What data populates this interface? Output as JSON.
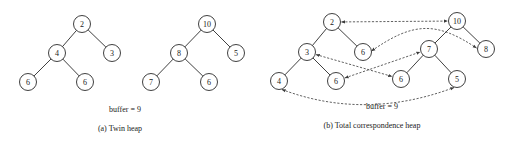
{
  "panels": [
    {
      "id": "a",
      "caption": "(a) Twin heap",
      "buffer_label": "buffer = 9",
      "caption_pos": [
        120,
        131
      ],
      "buffer_pos": [
        125,
        112
      ],
      "heaps": [
        {
          "name": "min-heap",
          "nodes": [
            {
              "id": "a_min_0",
              "value": "2",
              "x": 82,
              "y": 24
            },
            {
              "id": "a_min_1",
              "value": "4",
              "x": 57,
              "y": 53
            },
            {
              "id": "a_min_2",
              "value": "3",
              "x": 112,
              "y": 53
            },
            {
              "id": "a_min_3",
              "value": "6",
              "x": 28,
              "y": 82
            },
            {
              "id": "a_min_4",
              "value": "6",
              "x": 85,
              "y": 82
            }
          ],
          "edges": [
            [
              "a_min_0",
              "a_min_1"
            ],
            [
              "a_min_0",
              "a_min_2"
            ],
            [
              "a_min_1",
              "a_min_3"
            ],
            [
              "a_min_1",
              "a_min_4"
            ]
          ]
        },
        {
          "name": "max-heap",
          "nodes": [
            {
              "id": "a_max_0",
              "value": "10",
              "x": 207,
              "y": 24
            },
            {
              "id": "a_max_1",
              "value": "8",
              "x": 179,
              "y": 53
            },
            {
              "id": "a_max_2",
              "value": "5",
              "x": 236,
              "y": 53
            },
            {
              "id": "a_max_3",
              "value": "7",
              "x": 151,
              "y": 82
            },
            {
              "id": "a_max_4",
              "value": "6",
              "x": 209,
              "y": 82
            }
          ],
          "edges": [
            [
              "a_max_0",
              "a_max_1"
            ],
            [
              "a_max_0",
              "a_max_2"
            ],
            [
              "a_max_1",
              "a_max_3"
            ],
            [
              "a_max_1",
              "a_max_4"
            ]
          ]
        }
      ],
      "correspondences": []
    },
    {
      "id": "b",
      "caption": "(b) Total correspondence heap",
      "buffer_label": "buffer = 9",
      "caption_pos": [
        372,
        128
      ],
      "buffer_pos": [
        382,
        109
      ],
      "heaps": [
        {
          "name": "min-heap",
          "nodes": [
            {
              "id": "b_min_0",
              "value": "2",
              "x": 332,
              "y": 22
            },
            {
              "id": "b_min_1",
              "value": "3",
              "x": 307,
              "y": 52
            },
            {
              "id": "b_min_2",
              "value": "6",
              "x": 363,
              "y": 52
            },
            {
              "id": "b_min_3",
              "value": "4",
              "x": 279,
              "y": 81
            },
            {
              "id": "b_min_4",
              "value": "6",
              "x": 336,
              "y": 81
            }
          ],
          "edges": [
            [
              "b_min_0",
              "b_min_1"
            ],
            [
              "b_min_0",
              "b_min_2"
            ],
            [
              "b_min_1",
              "b_min_3"
            ],
            [
              "b_min_1",
              "b_min_4"
            ]
          ]
        },
        {
          "name": "max-heap",
          "nodes": [
            {
              "id": "b_max_0",
              "value": "10",
              "x": 457,
              "y": 21
            },
            {
              "id": "b_max_1",
              "value": "7",
              "x": 429,
              "y": 49
            },
            {
              "id": "b_max_2",
              "value": "8",
              "x": 486,
              "y": 49
            },
            {
              "id": "b_max_3",
              "value": "6",
              "x": 401,
              "y": 79
            },
            {
              "id": "b_max_4",
              "value": "5",
              "x": 457,
              "y": 79
            }
          ],
          "edges": [
            [
              "b_max_0",
              "b_max_1"
            ],
            [
              "b_max_0",
              "b_max_2"
            ],
            [
              "b_max_1",
              "b_max_3"
            ],
            [
              "b_max_1",
              "b_max_4"
            ]
          ]
        }
      ],
      "correspondences": [
        {
          "from": "b_min_0",
          "to": "b_max_0",
          "style": "straight",
          "label": "2 <-> 10"
        },
        {
          "from": "b_min_2",
          "to": "b_max_2",
          "style": "arc-up",
          "label": "6 <-> 8"
        },
        {
          "from": "b_min_1",
          "to": "b_max_3",
          "style": "straight",
          "label": "3 <-> 6"
        },
        {
          "from": "b_min_4",
          "to": "b_max_1",
          "style": "straight",
          "label": "6 <-> 7"
        },
        {
          "from": "b_min_3",
          "to": "b_max_4",
          "style": "arc-down",
          "label": "4 <-> 5"
        }
      ]
    }
  ],
  "node_radius": 8.5
}
